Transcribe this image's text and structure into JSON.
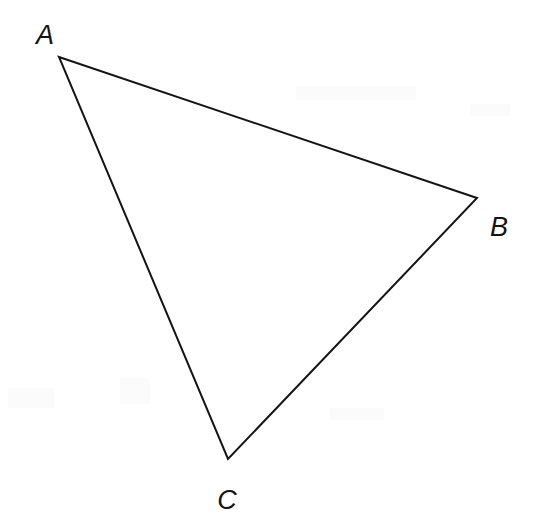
{
  "figure": {
    "kind": "geometry-diagram",
    "shape_name": "triangle",
    "width": 544,
    "height": 516,
    "background_color": "#ffffff",
    "stroke_color": "#141414",
    "stroke_width": 2,
    "fill_color": "none",
    "label_color": "#141414",
    "label_font_size": 27,
    "label_font_style": "italic",
    "vertices": [
      {
        "name": "A",
        "x": 59,
        "y": 57,
        "label": "A",
        "label_x": 45,
        "label_y": 35
      },
      {
        "name": "B",
        "x": 477,
        "y": 198,
        "label": "B",
        "label_x": 499,
        "label_y": 227
      },
      {
        "name": "C",
        "x": 228,
        "y": 459,
        "label": "C",
        "label_x": 227,
        "label_y": 500
      }
    ],
    "edges": [
      {
        "name": "AB",
        "from": "A",
        "to": "B"
      },
      {
        "name": "BC",
        "from": "B",
        "to": "C"
      },
      {
        "name": "CA",
        "from": "C",
        "to": "A"
      }
    ],
    "polygon_points": "59,57 477,198 228,459"
  }
}
